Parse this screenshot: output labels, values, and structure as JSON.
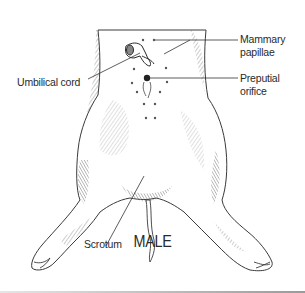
{
  "figure": {
    "caption": "MALE",
    "labels": {
      "mammary_papillae_line1": "Mammary",
      "mammary_papillae_line2": "papillae",
      "umbilical_cord": "Umbilical cord",
      "preputial_orifice_line1": "Preputial",
      "preputial_orifice_line2": "orifice",
      "scrotum": "Scrotum"
    },
    "colors": {
      "background": "#ffffff",
      "ink": "#2a2a2a",
      "shading": "#8a8a8a",
      "divider": "#9a9a9a"
    }
  }
}
